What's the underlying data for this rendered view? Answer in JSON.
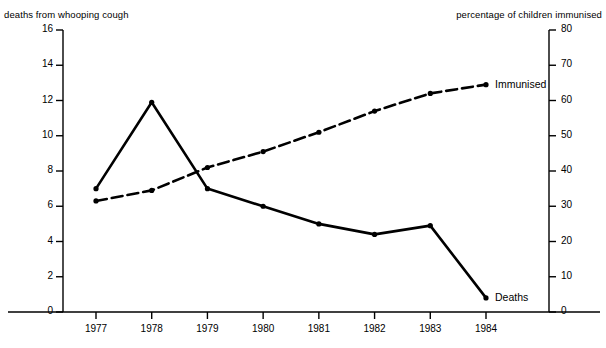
{
  "chart_data": {
    "type": "line",
    "title": "",
    "categories": [
      "1977",
      "1978",
      "1979",
      "1980",
      "1981",
      "1982",
      "1983",
      "1984"
    ],
    "x": [
      1977,
      1978,
      1979,
      1980,
      1981,
      1982,
      1983,
      1984
    ],
    "xlabel": "",
    "grid": false,
    "legend_position": "inline-right-of-series-end",
    "axes": {
      "left": {
        "label": "deaths from whooping cough",
        "ylim": [
          0,
          16
        ],
        "ticks": [
          0,
          2,
          4,
          6,
          8,
          10,
          12,
          14,
          16
        ],
        "tick_labels": [
          "0",
          "2",
          "4",
          "6",
          "8",
          "10",
          "12",
          "14",
          "16"
        ]
      },
      "right": {
        "label": "percentage of children immunised",
        "ylim": [
          0,
          80
        ],
        "ticks": [
          0,
          10,
          20,
          30,
          40,
          50,
          60,
          70,
          80
        ],
        "tick_labels": [
          "0",
          "10",
          "20",
          "30",
          "40",
          "50",
          "60",
          "70",
          "80"
        ]
      }
    },
    "series": [
      {
        "name": "Deaths",
        "label": "Deaths",
        "axis": "left",
        "style": "solid",
        "color": "#000000",
        "marker": "dot",
        "values": [
          7.0,
          11.9,
          7.0,
          6.0,
          5.0,
          4.4,
          4.9,
          0.8
        ]
      },
      {
        "name": "Immunised",
        "label": "Immunised",
        "axis": "right",
        "style": "dashed",
        "color": "#000000",
        "marker": "dot",
        "values": [
          31.5,
          34.5,
          41.0,
          45.5,
          51.0,
          57.0,
          62.0,
          64.5
        ]
      }
    ]
  }
}
